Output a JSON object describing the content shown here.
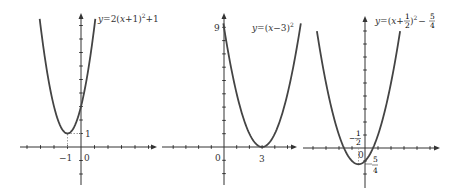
{
  "graphs": [
    {
      "id": "graph-1",
      "equation": {
        "lhs": "y",
        "eq": "=",
        "rhs_prefix": "2(",
        "var": "x",
        "rhs_mid": "+1)",
        "exp": "2",
        "rhs_suffix": "+1"
      },
      "equation_text": "y=2(x+1)^2+1",
      "origin_px": [
        81,
        147
      ],
      "unit_px": [
        13.5,
        13.5
      ],
      "x_range": [
        -3.06,
        1.06
      ],
      "coeffs": {
        "a": 2,
        "h": -1,
        "k": 1
      },
      "vertex": [
        -1,
        1
      ],
      "labels": {
        "x_vertex": "−1",
        "origin": "0",
        "y_vertex": "1"
      },
      "axis_extent": {
        "x_left": 20,
        "x_right": 155,
        "y_top": 14,
        "y_bottom": 185
      },
      "x_ticks": [
        -4,
        -3,
        -2,
        -1,
        1,
        2,
        3,
        4,
        5
      ],
      "y_ticks": [
        -3,
        -2,
        -1,
        1,
        2,
        3,
        4,
        5,
        6,
        7,
        8,
        9
      ]
    },
    {
      "id": "graph-2",
      "equation_text": "y=(x-3)^2",
      "equation": {
        "lhs": "y",
        "eq": "=",
        "rhs_prefix": "(",
        "var": "x",
        "rhs_mid": "−3)",
        "exp": "2"
      },
      "origin_px": [
        224,
        147
      ],
      "unit_px": [
        12.7,
        13.3
      ],
      "x_range": [
        -0.05,
        6.05
      ],
      "coeffs": {
        "a": 1,
        "h": 3,
        "k": 0
      },
      "vertex": [
        3,
        0
      ],
      "labels": {
        "origin": "0",
        "x_vertex": "3",
        "y_intercept": "9"
      },
      "axis_extent": {
        "x_left": 162,
        "x_right": 297,
        "y_top": 14,
        "y_bottom": 185
      },
      "x_ticks": [
        -4,
        -3,
        -2,
        -1,
        1,
        2,
        3,
        4,
        5
      ],
      "y_ticks": [
        -3,
        -2,
        -1,
        1,
        2,
        3,
        4,
        5,
        6,
        7,
        8,
        9
      ]
    },
    {
      "id": "graph-3",
      "equation_text": "y=(x+1/2)^2-5/4",
      "equation": {
        "lhs": "y",
        "eq": "=",
        "rhs_prefix": "(",
        "var": "x",
        "plus": "+",
        "frac1_num": "1",
        "frac1_den": "2",
        "close": ")",
        "exp": "2",
        "minus": "−",
        "frac2_num": "5",
        "frac2_den": "4"
      },
      "origin_px": [
        365,
        148
      ],
      "unit_px": [
        13,
        13
      ],
      "x_range": [
        -3.7,
        2.7
      ],
      "coeffs": {
        "a": 1,
        "h": -0.5,
        "k": -1.25
      },
      "vertex": [
        -0.5,
        -1.25
      ],
      "labels": {
        "origin": "0",
        "x_vertex_num": "1",
        "x_vertex_den": "2",
        "x_vertex_sign": "−",
        "y_vertex_num": "5",
        "y_vertex_den": "4",
        "y_vertex_sign": "−"
      },
      "axis_extent": {
        "x_left": 303,
        "x_right": 440,
        "y_top": 16,
        "y_bottom": 188
      },
      "x_ticks": [
        -4,
        -3,
        -2,
        -1,
        1,
        2,
        3,
        4,
        5
      ],
      "y_ticks": [
        -3,
        -2,
        -1,
        1,
        2,
        3,
        4,
        5,
        6,
        7,
        8,
        9
      ]
    }
  ]
}
